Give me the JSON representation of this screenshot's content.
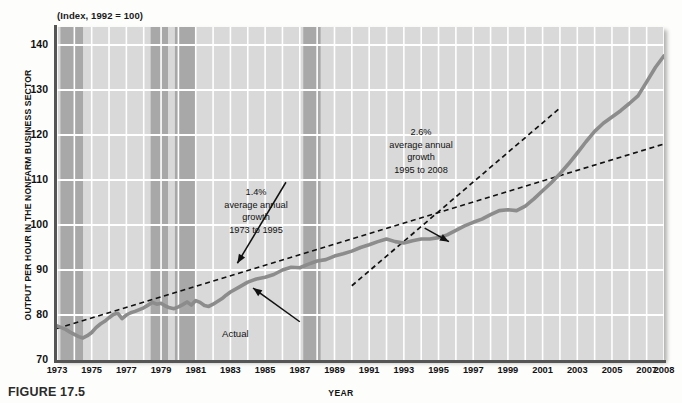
{
  "figure": {
    "caption": "FIGURE 17.5",
    "subtitle": "(Index, 1992 = 100)",
    "y_axis_title": "OUTPUT PER HOUR IN THE NONFARM BUSINESS SECTOR",
    "x_axis_title": "YEAR"
  },
  "annotations": {
    "trend_early": "1.4%\naverage annual\ngrowth\n1973 to 1995",
    "trend_late": "2.6%\naverage annual\ngrowth\n1995 to 2008",
    "actual": "Actual"
  },
  "colors": {
    "plot_background": "#d9d9d9",
    "recession_band": "#a8a8a8",
    "gridline": "#ffffff",
    "data_line": "#8c8c8c",
    "trend_line": "#111111",
    "axis": "#555555"
  },
  "chart_data": {
    "type": "line",
    "title": "Output per hour in the nonfarm business sector",
    "subtitle": "(Index, 1992 = 100)",
    "xlabel": "YEAR",
    "ylabel": "OUTPUT PER HOUR IN THE NONFARM BUSINESS SECTOR",
    "xlim": [
      1973,
      2008
    ],
    "ylim": [
      70,
      144
    ],
    "yticks": [
      70,
      80,
      90,
      100,
      110,
      120,
      130,
      140
    ],
    "xticks": [
      1973,
      1975,
      1977,
      1979,
      1981,
      1983,
      1985,
      1987,
      1989,
      1991,
      1993,
      1995,
      1997,
      1999,
      2001,
      2003,
      2005,
      2007,
      2008
    ],
    "grid": true,
    "legend": "none",
    "series": [
      {
        "name": "Actual",
        "style": "solid-thick-gray",
        "x": [
          1973.0,
          1973.25,
          1973.5,
          1973.75,
          1974.0,
          1974.25,
          1974.5,
          1974.75,
          1975.0,
          1975.25,
          1975.5,
          1975.75,
          1976.0,
          1976.25,
          1976.5,
          1976.75,
          1977.0,
          1977.25,
          1977.5,
          1977.75,
          1978.0,
          1978.25,
          1978.5,
          1978.75,
          1979.0,
          1979.25,
          1979.5,
          1979.75,
          1980.0,
          1980.25,
          1980.5,
          1980.75,
          1981.0,
          1981.25,
          1981.5,
          1981.75,
          1982.0,
          1982.25,
          1982.5,
          1982.75,
          1983.0,
          1983.5,
          1984.0,
          1984.5,
          1985.0,
          1985.5,
          1986.0,
          1986.5,
          1987.0,
          1987.5,
          1988.0,
          1988.5,
          1989.0,
          1989.5,
          1990.0,
          1990.5,
          1991.0,
          1991.5,
          1992.0,
          1992.5,
          1993.0,
          1993.5,
          1994.0,
          1994.5,
          1995.0,
          1995.5,
          1996.0,
          1996.5,
          1997.0,
          1997.5,
          1998.0,
          1998.5,
          1999.0,
          1999.5,
          2000.0,
          2000.5,
          2001.0,
          2001.5,
          2002.0,
          2002.5,
          2003.0,
          2003.5,
          2004.0,
          2004.5,
          2005.0,
          2005.5,
          2006.0,
          2006.5,
          2007.0,
          2007.5,
          2008.0
        ],
        "y": [
          77.6,
          77.2,
          76.8,
          76.2,
          75.7,
          75.2,
          74.9,
          75.4,
          76.1,
          77.2,
          78.0,
          78.6,
          79.4,
          80.1,
          80.4,
          79.2,
          80.0,
          80.5,
          80.8,
          81.2,
          81.6,
          82.2,
          82.8,
          82.4,
          82.6,
          82.0,
          81.6,
          81.4,
          81.8,
          82.3,
          82.9,
          82.2,
          83.2,
          82.8,
          82.1,
          81.9,
          82.4,
          83.0,
          83.6,
          84.4,
          85.1,
          86.2,
          87.3,
          88.0,
          88.4,
          89.0,
          90.0,
          90.6,
          90.5,
          91.3,
          92.0,
          92.3,
          93.1,
          93.6,
          94.2,
          95.0,
          95.6,
          96.3,
          96.9,
          96.3,
          96.0,
          96.5,
          96.9,
          96.9,
          97.2,
          97.8,
          98.8,
          99.8,
          100.6,
          101.3,
          102.3,
          103.2,
          103.4,
          103.2,
          104.2,
          105.8,
          107.6,
          109.4,
          111.4,
          113.6,
          116.0,
          118.5,
          120.8,
          122.6,
          124.0,
          125.4,
          127.0,
          128.7,
          131.8,
          135.0,
          137.6
        ]
      },
      {
        "name": "1.4% trend 1973 to 1995",
        "style": "dashed-black",
        "x": [
          1973,
          2008
        ],
        "y": [
          77.0,
          118.0
        ]
      },
      {
        "name": "2.6% trend 1995 to 2008",
        "style": "dashed-black",
        "x": [
          1990,
          2002
        ],
        "y": [
          86.5,
          126.0
        ]
      }
    ],
    "recession_bands": [
      {
        "start": 1973.2,
        "end": 1974.5
      },
      {
        "start": 1978.4,
        "end": 1979.4
      },
      {
        "start": 1979.8,
        "end": 1981.0
      },
      {
        "start": 1987.2,
        "end": 1988.2
      }
    ],
    "arrows": [
      {
        "from": [
          1986.2,
          109.5
        ],
        "to": [
          1983.4,
          91.5
        ],
        "label": "1.4% trend pointer"
      },
      {
        "from": [
          1994.2,
          99.3
        ],
        "to": [
          1995.6,
          96.3
        ],
        "label": "2.6% trend pointer"
      },
      {
        "from": [
          1987.0,
          78.5
        ],
        "to": [
          1984.3,
          86.0
        ],
        "label": "Actual pointer"
      }
    ]
  }
}
